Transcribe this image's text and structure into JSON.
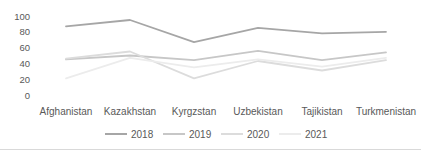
{
  "chart_data": {
    "type": "line",
    "title": "",
    "xlabel": "",
    "ylabel": "",
    "categories": [
      "Afghanistan",
      "Kazakhstan",
      "Kyrgzstan",
      "Uzbekistan",
      "Tajikistan",
      "Turkmenistan"
    ],
    "series": [
      {
        "name": "2018",
        "color": "#a6a6a6",
        "values": [
          87,
          95,
          67,
          85,
          78,
          80
        ]
      },
      {
        "name": "2019",
        "color": "#c7c7c7",
        "values": [
          45,
          50,
          44,
          56,
          44,
          54
        ]
      },
      {
        "name": "2020",
        "color": "#dcdcdc",
        "values": [
          46,
          55,
          21,
          43,
          31,
          44
        ]
      },
      {
        "name": "2021",
        "color": "#ececec",
        "values": [
          21,
          47,
          35,
          45,
          36,
          47
        ]
      }
    ],
    "y_ticks": [
      0,
      20,
      40,
      60,
      80,
      100
    ],
    "ylim": [
      0,
      100
    ],
    "grid": false,
    "legend_position": "bottom",
    "text_color": "#595959"
  }
}
